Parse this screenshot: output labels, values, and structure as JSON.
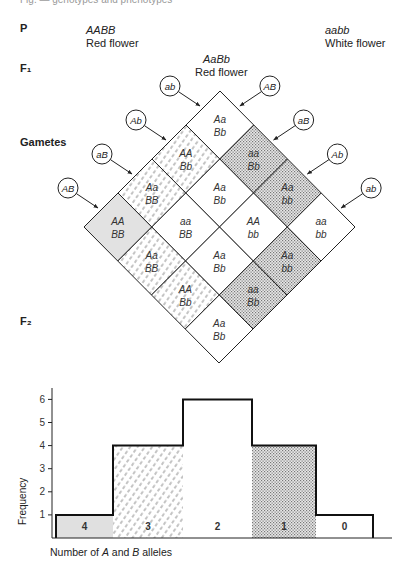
{
  "header_fragment": "Fig.   —   genotypes and phenotypes",
  "labels": {
    "p": "P",
    "f1": "F₁",
    "gametes": "Gametes",
    "f2": "F₂"
  },
  "parents": {
    "left": {
      "genotype": "AABB",
      "phenotype": "Red flower"
    },
    "right": {
      "genotype": "aabb",
      "phenotype": "White flower"
    }
  },
  "f1": {
    "genotype": "AaBb",
    "phenotype": "Red flower"
  },
  "punnett": {
    "left_gametes": [
      "ab",
      "Ab",
      "aB",
      "AB"
    ],
    "right_gametes": [
      "AB",
      "aB",
      "Ab",
      "ab"
    ],
    "cells": [
      [
        {
          "a": "Aa",
          "b": "Bb",
          "fill": "white"
        },
        {
          "a": "aa",
          "b": "Bb",
          "fill": "dots"
        },
        {
          "a": "Aa",
          "b": "bb",
          "fill": "dots"
        },
        {
          "a": "aa",
          "b": "bb",
          "fill": "white"
        }
      ],
      [
        {
          "a": "AA",
          "b": "Bb",
          "fill": "dash"
        },
        {
          "a": "Aa",
          "b": "Bb",
          "fill": "white"
        },
        {
          "a": "AA",
          "b": "bb",
          "fill": "white"
        },
        {
          "a": "Aa",
          "b": "bb",
          "fill": "dots"
        }
      ],
      [
        {
          "a": "Aa",
          "b": "BB",
          "fill": "dash"
        },
        {
          "a": "aa",
          "b": "BB",
          "fill": "white"
        },
        {
          "a": "Aa",
          "b": "Bb",
          "fill": "white"
        },
        {
          "a": "aa",
          "b": "Bb",
          "fill": "dots"
        }
      ],
      [
        {
          "a": "AA",
          "b": "BB",
          "fill": "gray"
        },
        {
          "a": "Aa",
          "b": "BB",
          "fill": "dash"
        },
        {
          "a": "AA",
          "b": "Bb",
          "fill": "dash"
        },
        {
          "a": "Aa",
          "b": "Bb",
          "fill": "white"
        }
      ]
    ]
  },
  "chart_data": {
    "type": "bar",
    "title": "",
    "xlabel": "Number of A and B alleles",
    "ylabel": "Frequency",
    "categories": [
      "4",
      "3",
      "2",
      "1",
      "0"
    ],
    "values": [
      1,
      4,
      6,
      4,
      1
    ],
    "fills": [
      "gray",
      "dash",
      "white",
      "dots",
      "white"
    ],
    "yticks": [
      1,
      2,
      3,
      4,
      5,
      6
    ],
    "ylim": [
      0,
      6.5
    ],
    "grid": false,
    "legend": "none"
  }
}
